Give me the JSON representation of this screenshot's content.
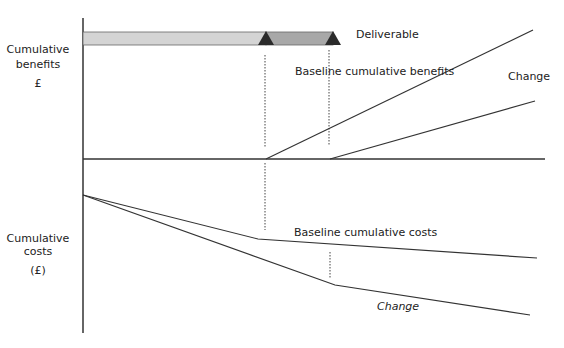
{
  "diagram": {
    "y_axis_top_label": {
      "line1": "Cumulative",
      "line2": "benefits",
      "unit": "£"
    },
    "y_axis_bottom_label": {
      "line1": "Cumulative",
      "line2": "costs",
      "unit": "(£)"
    },
    "deliverable_label": "Deliverable",
    "baseline_benefits_label": "Baseline cumulative benefits",
    "change_benefits_label": "Change",
    "baseline_costs_label": "Baseline cumulative costs",
    "change_costs_label": "Change",
    "colors": {
      "line": "#333333",
      "bar_light": "#d4d4d4",
      "bar_dark": "#a8a8a8",
      "triangle": "#2b2b2b"
    }
  }
}
